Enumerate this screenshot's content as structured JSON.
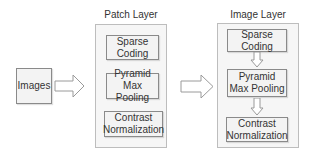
{
  "diagram": {
    "input": {
      "label": "Images"
    },
    "patch_layer": {
      "title": "Patch Layer",
      "blocks": [
        "Sparse Coding",
        "Pyramid Max Pooling",
        "Contrast Normalization"
      ]
    },
    "image_layer": {
      "title": "Image Layer",
      "blocks": [
        "Sparse Coding",
        "Pyramid Max Pooling",
        "Contrast Normalization"
      ]
    },
    "edges": [
      {
        "from": "Images",
        "to": "Patch Layer",
        "style": "hollow-block-arrow"
      },
      {
        "from": "Patch Layer",
        "to": "Image Layer",
        "style": "hollow-block-arrow"
      },
      {
        "from": "Image Layer.Sparse Coding",
        "to": "Image Layer.Pyramid Max Pooling",
        "style": "hollow-down-arrow"
      },
      {
        "from": "Image Layer.Pyramid Max Pooling",
        "to": "Image Layer.Contrast Normalization",
        "style": "hollow-down-arrow"
      }
    ]
  }
}
